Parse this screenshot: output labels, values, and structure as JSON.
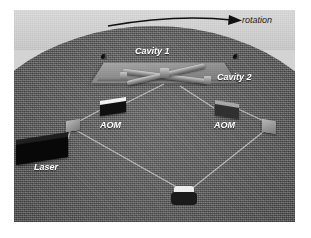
{
  "figure": {
    "type": "optics-schematic"
  },
  "annotations": {
    "rotation": "rotation",
    "cavity_1": "Cavity 1",
    "cavity_2": "Cavity 2",
    "aom_left": "AOM",
    "aom_right": "AOM",
    "laser": "Laser"
  },
  "icons": {
    "rotation_arrow": "curved-arrow-right-icon",
    "marker_left": "disk-marker-icon",
    "marker_right": "disk-marker-icon"
  },
  "components": [
    {
      "name": "laser",
      "label": "Laser"
    },
    {
      "name": "beam-splitter-left",
      "label": ""
    },
    {
      "name": "aom-left",
      "label": "AOM"
    },
    {
      "name": "aom-right",
      "label": "AOM"
    },
    {
      "name": "cavity-1",
      "label": "Cavity 1"
    },
    {
      "name": "cavity-2",
      "label": "Cavity 2"
    },
    {
      "name": "mirror-bottom",
      "label": ""
    },
    {
      "name": "mirror-right",
      "label": ""
    }
  ],
  "colors": {
    "disk": "#4d4d4d",
    "background_band": "#d3d3d3",
    "label_text": "#ffffff",
    "rotation_text": "#1c1c1c",
    "beam_line": "#c8c8c8",
    "laser_body": "#080808",
    "aom_left_body": "#101010",
    "aom_right_body": "#303030"
  }
}
